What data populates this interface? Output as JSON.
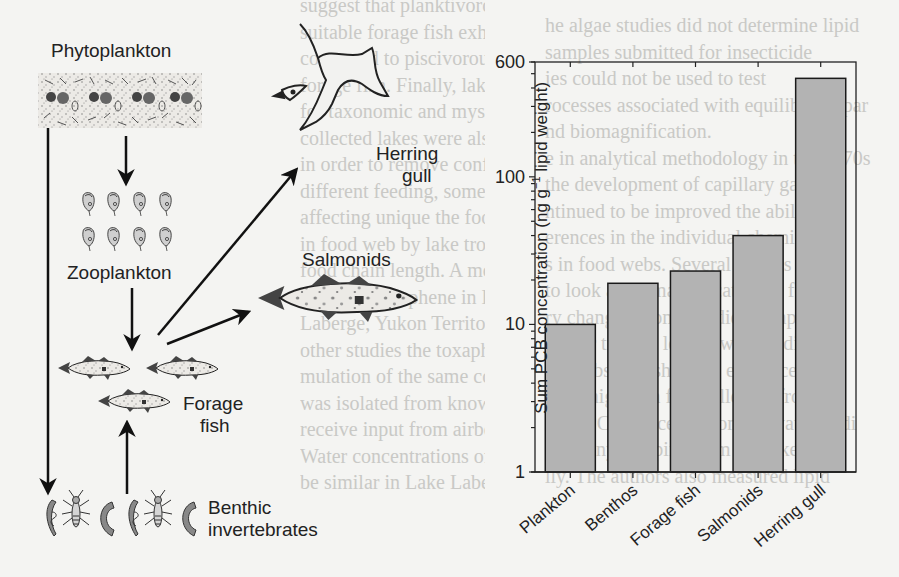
{
  "figure": {
    "food_web": {
      "nodes": [
        {
          "id": "phytoplankton",
          "label": "Phytoplankton"
        },
        {
          "id": "zooplankton",
          "label": "Zooplankton"
        },
        {
          "id": "forage_fish",
          "label": "Forage\nfish",
          "line1": "Forage",
          "line2": "fish"
        },
        {
          "id": "salmonids",
          "label": "Salmonids"
        },
        {
          "id": "herring_gull",
          "label": "Herring\ngull",
          "line1": "Herring",
          "line2": "gull"
        },
        {
          "id": "benthic",
          "label": "Benthic\ninvertebrates",
          "line1": "Benthic",
          "line2": "invertebrates"
        }
      ],
      "arrows": [
        {
          "from": "phytoplankton",
          "to": "zooplankton"
        },
        {
          "from": "phytoplankton",
          "to": "benthic"
        },
        {
          "from": "zooplankton",
          "to": "forage_fish"
        },
        {
          "from": "benthic",
          "to": "forage_fish"
        },
        {
          "from": "forage_fish",
          "to": "salmonids"
        },
        {
          "from": "forage_fish",
          "to": "herring_gull"
        }
      ]
    }
  },
  "chart_data": {
    "type": "bar",
    "title": "",
    "categories": [
      "Plankton",
      "Benthos",
      "Forage fish",
      "Salmonids",
      "Herring gull"
    ],
    "values": [
      10,
      19,
      23,
      40,
      465
    ],
    "xlabel": "",
    "ylabel": "Sum PCB concentration (ng g⁻¹ lipid weight)",
    "ylabel_parts": {
      "pre": "Sum PCB concentration (ng g",
      "sup": "−1",
      "post": " lipid weight)"
    },
    "yscale": "log",
    "ylim": [
      1,
      600
    ],
    "yticks": [
      {
        "value": 1,
        "label": "1"
      },
      {
        "value": 10,
        "label": "10"
      },
      {
        "value": 100,
        "label": "100"
      },
      {
        "value": 600,
        "label": "600"
      }
    ],
    "grid": false,
    "legend": null,
    "bar_color": "#b3b3b3",
    "edge_color": "#1a1a1a"
  },
  "background_text": [
    "he algae studies did not determine lipid",
    "samples submitted for insecticide",
    "ies could not be used to test",
    "rocesses associated with equilibrium par",
    "nd biomagnification.",
    "e in analytical methodology in the 1970s",
    "the development of capillary gas chro",
    "ntinued to be improved the ability",
    "erences in the individual chemical",
    "s in food webs. Several studies",
    "to look at biomagnification in food",
    "ry changes. Some studies compared",
    "higher trophic levels, with studies",
    "od webs also showing evidence",
    "were higher in fish collected from",
    "total PCB concentrations in water, sedi",
    "ds, shiny sculpins from the lake show",
    "lly. The authors also measured lipid"
  ],
  "background_text_right": [
    "suggest that planktivorous lake trout (Sa",
    "suitable forage fish exhibited lower PCB",
    "compared to piscivorous lake trout from",
    "forage fish. Finally, lake trout from lake",
    "for taxonomic and mysid shrimp had hig",
    "collected lakes were also compared",
    "in order to remove confounding between",
    "different feeding, some studies attributed",
    "affecting unique the food web, diff",
    "in food web by lake trout, it seems",
    "food chain length. A more recent stu",
    "enriched toxaphene in Lake Laberge",
    "Laberge, Yukon Territory. Recent, as",
    "other studies the toxaphene was mos",
    "mulation of the same contaminant in fo",
    "was isolated from known point sources",
    "receive input from airborne toxaphene",
    "Water concentrations of toxaphene were",
    "be similar in Lake Laberge relative to"
  ]
}
